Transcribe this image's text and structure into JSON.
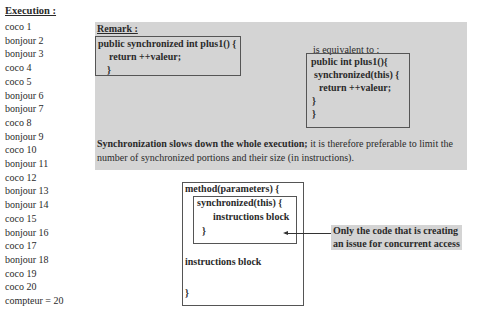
{
  "execution": {
    "title": "Execution :",
    "lines": [
      "coco 1",
      "bonjour 2",
      "bonjour 3",
      "coco 4",
      "coco 5",
      "bonjour 6",
      "bonjour 7",
      "coco 8",
      "bonjour 9",
      "coco 10",
      "bonjour 11",
      "coco 12",
      "bonjour 13",
      "bonjour 14",
      "coco 15",
      "bonjour 16",
      "coco 17",
      "bonjour 18",
      "coco 19",
      "coco 20",
      "compteur = 20"
    ]
  },
  "remark": {
    "title": "Remark :",
    "left_code": [
      "public synchronized int plus1() {",
      "return ++valeur;",
      "}"
    ],
    "equivalent_label": "is equivalent to :",
    "right_code": [
      "public int plus1(){",
      "synchronized(this) {",
      "return ++valeur;",
      "}",
      "}"
    ],
    "note_bold": "Synchronization slows down the whole execution;",
    "note_rest": " it is therefore preferable to limit the number of synchronized portions and their size (in instructions)."
  },
  "diagram": {
    "method_line": "method(parameters) {",
    "sync_line": "synchronized(this) {",
    "inner_instructions": "instructions block",
    "inner_close": "}",
    "outer_instructions": "instructions block",
    "outer_close": "}",
    "callout": [
      "Only the code that is creating",
      "an issue for concurrent access"
    ]
  }
}
